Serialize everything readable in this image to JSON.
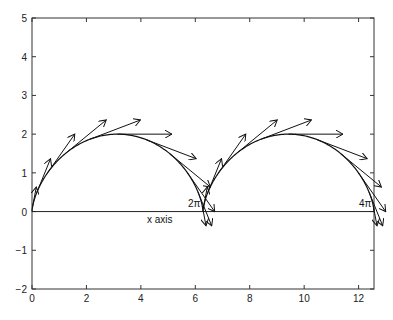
{
  "chart_data": {
    "type": "line",
    "title": "",
    "xlabel": "",
    "ylabel": "",
    "xlim": [
      0,
      12.566
    ],
    "ylim": [
      -2,
      5
    ],
    "grid": false,
    "x_ticks": [
      0,
      2,
      4,
      6,
      8,
      10,
      12
    ],
    "y_ticks": [
      -2,
      -1,
      0,
      1,
      2,
      3,
      4,
      5
    ],
    "x_tick_labels": [
      "0",
      "2",
      "4",
      "6",
      "8",
      "10",
      "12"
    ],
    "y_tick_labels": [
      "−2",
      "−1",
      "0",
      "1",
      "2",
      "3",
      "4",
      "5"
    ],
    "series": [
      {
        "name": "cycloid",
        "kind": "parametric curve",
        "equation": "x = t - sin t, y = 1 - cos t",
        "t_range": [
          0,
          12.566
        ]
      },
      {
        "name": "velocity vectors",
        "kind": "quiver",
        "t_step": 0.5236,
        "scale": 1,
        "arrows": [
          {
            "x": 0.024,
            "y": 0.134,
            "u": 0.134,
            "v": 0.5
          },
          {
            "x": 0.181,
            "y": 0.5,
            "u": 0.5,
            "v": 0.866
          },
          {
            "x": 0.571,
            "y": 1.0,
            "u": 1.0,
            "v": 1.0
          },
          {
            "x": 1.228,
            "y": 1.5,
            "u": 1.5,
            "v": 0.866
          },
          {
            "x": 2.118,
            "y": 1.866,
            "u": 1.866,
            "v": 0.5
          },
          {
            "x": 3.142,
            "y": 2.0,
            "u": 2.0,
            "v": 0.0
          },
          {
            "x": 4.165,
            "y": 1.866,
            "u": 1.866,
            "v": -0.5
          },
          {
            "x": 5.055,
            "y": 1.5,
            "u": 1.5,
            "v": -0.866
          },
          {
            "x": 5.712,
            "y": 1.0,
            "u": 1.0,
            "v": -1.0
          },
          {
            "x": 6.102,
            "y": 0.5,
            "u": 0.5,
            "v": -0.866
          },
          {
            "x": 6.259,
            "y": 0.134,
            "u": 0.134,
            "v": -0.5
          },
          {
            "x": 6.307,
            "y": 0.134,
            "u": 0.134,
            "v": 0.5
          },
          {
            "x": 6.464,
            "y": 0.5,
            "u": 0.5,
            "v": 0.866
          },
          {
            "x": 6.854,
            "y": 1.0,
            "u": 1.0,
            "v": 1.0
          },
          {
            "x": 7.511,
            "y": 1.5,
            "u": 1.5,
            "v": 0.866
          },
          {
            "x": 8.401,
            "y": 1.866,
            "u": 1.866,
            "v": 0.5
          },
          {
            "x": 9.425,
            "y": 2.0,
            "u": 2.0,
            "v": 0.0
          },
          {
            "x": 10.448,
            "y": 1.866,
            "u": 1.866,
            "v": -0.5
          },
          {
            "x": 11.338,
            "y": 1.5,
            "u": 1.5,
            "v": -0.866
          },
          {
            "x": 11.995,
            "y": 1.0,
            "u": 1.0,
            "v": -1.0
          },
          {
            "x": 12.385,
            "y": 0.5,
            "u": 0.5,
            "v": -0.866
          },
          {
            "x": 12.542,
            "y": 0.134,
            "u": 0.134,
            "v": -0.5
          }
        ]
      }
    ],
    "annotations": [
      {
        "text": "x axis",
        "x": 4.7,
        "y": -0.2
      },
      {
        "text": "2π",
        "x": 6.2,
        "y": 0.1
      },
      {
        "text": "4π",
        "x": 12.3,
        "y": 0.1
      }
    ],
    "horizontal_line": {
      "y": 0
    }
  },
  "labels": {
    "x_axis_annotation": "x axis",
    "two_pi": "2π",
    "four_pi": "4π"
  }
}
